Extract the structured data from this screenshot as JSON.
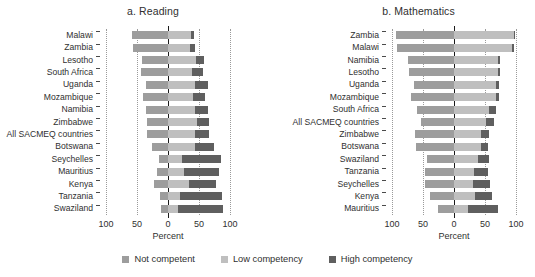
{
  "figure": {
    "axis_title": "Percent",
    "tick_labels": [
      "100",
      "50",
      "0",
      "50",
      "100"
    ]
  },
  "legend": {
    "items": [
      {
        "label": "Not competent",
        "color": "#9d9d9d",
        "key": "not"
      },
      {
        "label": "Low competency",
        "color": "#bfbfbf",
        "key": "low"
      },
      {
        "label": "High competency",
        "color": "#5f5f5f",
        "key": "high"
      }
    ]
  },
  "chart_data": [
    {
      "type": "bar",
      "id": "reading",
      "title": "a. Reading",
      "orientation": "horizontal",
      "stacked": "diverging",
      "xlabel": "Percent",
      "ylabel": "",
      "xlim": [
        -100,
        100
      ],
      "xticks": [
        -100,
        -50,
        0,
        50,
        100
      ],
      "xticklabels": [
        "100",
        "50",
        "0",
        "50",
        "100"
      ],
      "grid": true,
      "legend_position": "bottom",
      "series": [
        {
          "name": "Not competent",
          "side": "left"
        },
        {
          "name": "Low competency",
          "side": "right"
        },
        {
          "name": "High competency",
          "side": "right"
        }
      ],
      "categories": [
        "Malawi",
        "Zambia",
        "Lesotho",
        "South Africa",
        "Uganda",
        "Mozambique",
        "Namibia",
        "Zimbabwe",
        "All SACMEQ countries",
        "Botswana",
        "Seychelles",
        "Mauritius",
        "Kenya",
        "Tanzania",
        "Swaziland"
      ],
      "values": {
        "not_competent": [
          58,
          57,
          42,
          44,
          36,
          41,
          35,
          34,
          34,
          26,
          15,
          18,
          23,
          13,
          11
        ],
        "low_competency": [
          37,
          36,
          45,
          39,
          44,
          40,
          44,
          47,
          44,
          44,
          22,
          25,
          34,
          19,
          16
        ],
        "high_competency": [
          5,
          7,
          13,
          17,
          20,
          19,
          21,
          19,
          22,
          30,
          63,
          57,
          43,
          68,
          73
        ]
      }
    },
    {
      "type": "bar",
      "id": "mathematics",
      "title": "b. Mathematics",
      "orientation": "horizontal",
      "stacked": "diverging",
      "xlabel": "Percent",
      "ylabel": "",
      "xlim": [
        -100,
        100
      ],
      "xticks": [
        -100,
        -50,
        0,
        50,
        100
      ],
      "xticklabels": [
        "100",
        "50",
        "0",
        "50",
        "100"
      ],
      "grid": true,
      "legend_position": "bottom",
      "series": [
        {
          "name": "Not competent",
          "side": "left"
        },
        {
          "name": "Low competency",
          "side": "right"
        },
        {
          "name": "High competency",
          "side": "right"
        }
      ],
      "categories": [
        "Zambia",
        "Malawi",
        "Namibia",
        "Lesotho",
        "Uganda",
        "Mozambique",
        "South Africa",
        "All SACMEQ countries",
        "Zimbabwe",
        "Botswana",
        "Swaziland",
        "Tanzania",
        "Seychelles",
        "Kenya",
        "Mauritius"
      ],
      "values": {
        "not_competent": [
          94,
          92,
          74,
          72,
          65,
          70,
          60,
          54,
          63,
          62,
          44,
          47,
          47,
          38,
          26
        ],
        "low_competency": [
          96,
          94,
          71,
          71,
          67,
          68,
          57,
          51,
          44,
          43,
          38,
          33,
          31,
          34,
          23
        ],
        "high_competency": [
          2,
          2,
          4,
          4,
          6,
          4,
          10,
          13,
          12,
          12,
          19,
          22,
          27,
          27,
          48
        ]
      }
    }
  ]
}
